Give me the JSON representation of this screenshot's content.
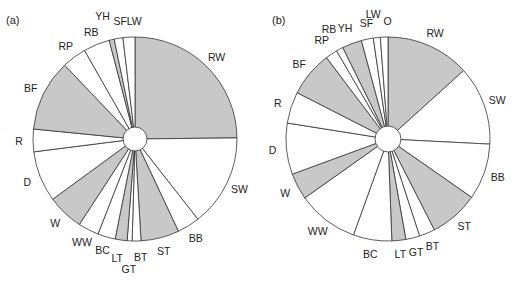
{
  "chart_data": [
    {
      "type": "pie",
      "title": "(a)",
      "start_angle_deg": 0,
      "direction": "clockwise",
      "center_hole": true,
      "colors": {
        "shaded": "#c8c8c8",
        "unshaded": "#ffffff",
        "stroke": "#333333"
      },
      "categories": [
        "RW",
        "SW",
        "BB",
        "ST",
        "BT",
        "GT",
        "LT",
        "BC",
        "WW",
        "W",
        "D",
        "R",
        "BF",
        "RP",
        "RB",
        "YH",
        "SF",
        "LW"
      ],
      "values": [
        25.0,
        14.7,
        3.6,
        6.1,
        1.4,
        0.8,
        1.9,
        2.8,
        3.3,
        5.8,
        8.1,
        3.6,
        11.4,
        3.9,
        4.2,
        0.8,
        1.4,
        1.9
      ],
      "shaded": [
        true,
        false,
        false,
        true,
        false,
        false,
        true,
        false,
        false,
        true,
        false,
        false,
        true,
        false,
        false,
        true,
        false,
        false
      ],
      "unit": "% of pie (estimated from angles)"
    },
    {
      "type": "pie",
      "title": "(b)",
      "start_angle_deg": 0,
      "direction": "clockwise",
      "center_hole": true,
      "colors": {
        "shaded": "#c8c8c8",
        "unshaded": "#ffffff",
        "stroke": "#333333"
      },
      "categories": [
        "RW",
        "SW",
        "BB",
        "ST",
        "BT",
        "GT",
        "LT",
        "BC",
        "WW",
        "W",
        "D",
        "R",
        "BF",
        "RP",
        "RB",
        "YH",
        "SF",
        "LW",
        "O"
      ],
      "values": [
        13.3,
        12.5,
        8.9,
        7.8,
        2.5,
        2.2,
        2.2,
        6.1,
        9.7,
        4.2,
        8.1,
        5.0,
        7.2,
        1.9,
        1.1,
        3.1,
        1.9,
        1.1,
        1.2
      ],
      "shaded": [
        true,
        false,
        false,
        true,
        false,
        false,
        true,
        false,
        false,
        true,
        false,
        false,
        true,
        false,
        false,
        true,
        false,
        false,
        false
      ],
      "unit": "% of pie (estimated from angles)"
    }
  ],
  "panels": {
    "a": {
      "label": "(a)"
    },
    "b": {
      "label": "(b)"
    }
  }
}
